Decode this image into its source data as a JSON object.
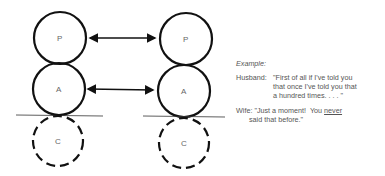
{
  "diagram": {
    "left_column": {
      "circles": [
        {
          "label": "P",
          "style": "solid"
        },
        {
          "label": "A",
          "style": "solid"
        },
        {
          "label": "C",
          "style": "dashed"
        }
      ]
    },
    "right_column": {
      "circles": [
        {
          "label": "P",
          "style": "solid"
        },
        {
          "label": "A",
          "style": "solid"
        },
        {
          "label": "C",
          "style": "dashed"
        }
      ]
    },
    "arrows": [
      {
        "from": "left.P",
        "to": "right.P",
        "type": "double-headed"
      },
      {
        "from": "left.A",
        "to": "right.A",
        "type": "double-headed"
      }
    ]
  },
  "example": {
    "title": "Example:",
    "husband": {
      "speaker": "Husband:",
      "line1": "\"First of all if I've told you",
      "line2": "that once I've told you that",
      "line3": "a hundred times. . . . \""
    },
    "wife": {
      "speaker": "Wife:",
      "line1_pre": "\"Just a moment!  You ",
      "line1_underlined": "never",
      "line2": "said that before.\""
    }
  }
}
